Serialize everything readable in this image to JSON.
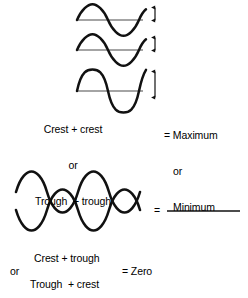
{
  "diagram": {
    "stroke_color": "#111111",
    "axis_color": "#3a3a3a",
    "background": "#ffffff",
    "constructive": {
      "caption_lines": [
        "Crest + crest",
        "or",
        "Trough  + trough"
      ],
      "result_lines": [
        "= Maximum",
        "or",
        "Minimum"
      ],
      "wave_1": {
        "label": "input wave 1",
        "amplitude": 1,
        "cycles": 1.5,
        "phase_deg": 0
      },
      "wave_2": {
        "label": "input wave 2",
        "amplitude": 1,
        "cycles": 1.5,
        "phase_deg": 0
      },
      "wave_sum": {
        "label": "resultant wave",
        "amplitude": 2,
        "cycles": 1.5,
        "phase_deg": 0
      },
      "amplitude_markers": [
        "amplitude A",
        "amplitude A",
        "amplitude 2A"
      ]
    },
    "destructive": {
      "caption_lines": [
        "Crest + trough",
        "or",
        "Trough  + crest"
      ],
      "result_text": "= Zero",
      "wave_1": {
        "label": "input wave 1",
        "amplitude": 1,
        "cycles": 2,
        "phase_deg": 0
      },
      "wave_2": {
        "label": "input wave 2",
        "amplitude": 1,
        "cycles": 2,
        "phase_deg": 180
      },
      "wave_sum": {
        "label": "resultant flat line",
        "amplitude": 0
      }
    },
    "equals_sign": "="
  }
}
